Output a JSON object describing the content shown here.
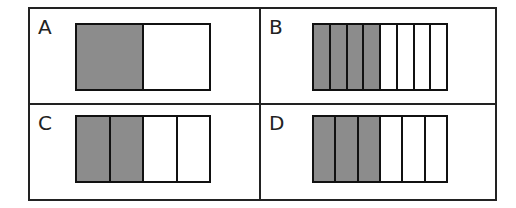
{
  "colors": {
    "shaded": "#8c8c8c",
    "unshaded": "#ffffff",
    "line": "#111111"
  },
  "panels": [
    {
      "label": "A",
      "parts": 2,
      "shaded": 1
    },
    {
      "label": "B",
      "parts": 8,
      "shaded": 4
    },
    {
      "label": "C",
      "parts": 4,
      "shaded": 2
    },
    {
      "label": "D",
      "parts": 6,
      "shaded": 3
    }
  ]
}
